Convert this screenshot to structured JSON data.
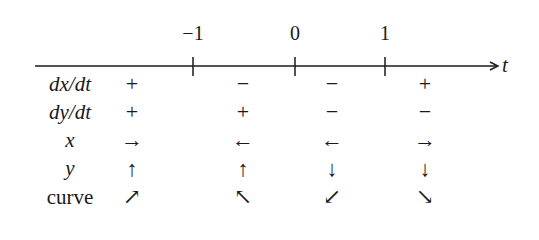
{
  "axis": {
    "variable": "t",
    "ticks": [
      {
        "label": "−1",
        "x": 193
      },
      {
        "label": "0",
        "x": 295
      },
      {
        "label": "1",
        "x": 385
      }
    ]
  },
  "rows": [
    {
      "label": "dx/dt",
      "italic": true,
      "y": 84,
      "cells": [
        "+",
        "−",
        "−",
        "+"
      ]
    },
    {
      "label": "dy/dt",
      "italic": true,
      "y": 112,
      "cells": [
        "+",
        "+",
        "−",
        "−"
      ]
    },
    {
      "label": "x",
      "italic": true,
      "y": 140,
      "cells": [
        "→",
        "←",
        "←",
        "→"
      ]
    },
    {
      "label": "y",
      "italic": true,
      "y": 169,
      "cells": [
        "↑",
        "↑",
        "↓",
        "↓"
      ]
    },
    {
      "label": "curve",
      "italic": false,
      "y": 198,
      "cells": [
        "↗",
        "↖",
        "↙",
        "↘"
      ]
    }
  ],
  "columns_x": [
    132,
    243,
    332,
    425
  ],
  "row_label_x": 70
}
